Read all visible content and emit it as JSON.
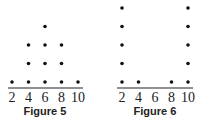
{
  "chart_data": [
    {
      "type": "scatter",
      "subtype": "dot_plot",
      "title": "Figure 5",
      "categories": [
        "2",
        "4",
        "6",
        "8",
        "10"
      ],
      "x": [
        2,
        4,
        6,
        8,
        10
      ],
      "values": [
        1,
        3,
        4,
        3,
        1
      ],
      "xlabel": "",
      "ylabel": "",
      "grid": false
    },
    {
      "type": "scatter",
      "subtype": "dot_plot",
      "title": "Figure 6",
      "categories": [
        "2",
        "4",
        "6",
        "8",
        "10"
      ],
      "x": [
        2,
        4,
        6,
        8,
        10
      ],
      "values": [
        5,
        1,
        0,
        1,
        5
      ],
      "xlabel": "",
      "ylabel": "",
      "grid": false
    }
  ],
  "figures": [
    {
      "caption": "Figure 5",
      "ticks": [
        "2",
        "4",
        "6",
        "8",
        "10"
      ]
    },
    {
      "caption": "Figure 6",
      "ticks": [
        "2",
        "4",
        "6",
        "8",
        "10"
      ]
    }
  ]
}
